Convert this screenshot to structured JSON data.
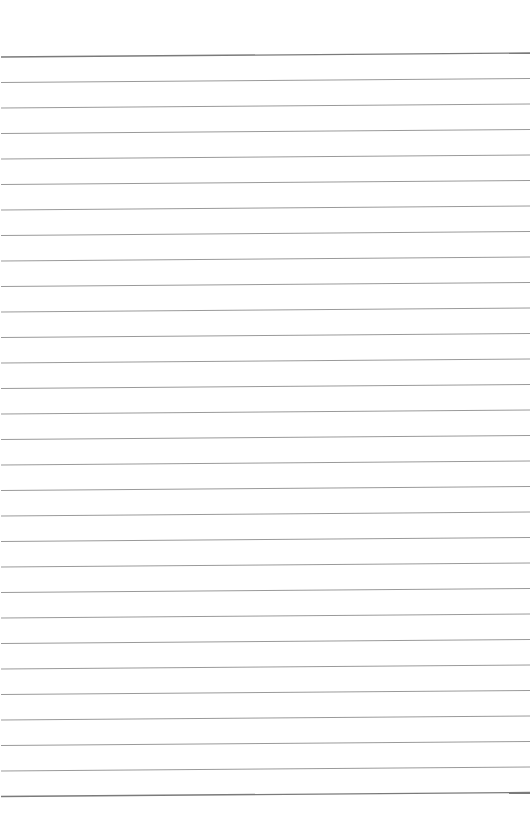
{
  "page": {
    "type": "lined-paper",
    "background_color": "#ffffff",
    "line_count": 30,
    "first_line_y_left": 57,
    "first_line_y_right": 53,
    "line_spacing": 25.5,
    "line_color": "#9a9a9a",
    "edge_line_color": "#7a7a7a",
    "line_width": 1,
    "edge_line_width": 1.4,
    "content": []
  }
}
